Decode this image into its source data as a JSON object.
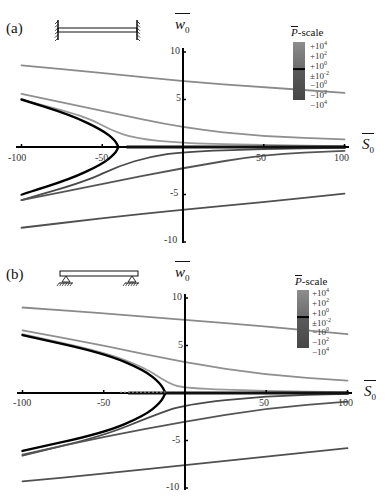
{
  "chart_data": [
    {
      "type": "line",
      "panel_label": "(a)",
      "boundary_condition": "clamped-clamped beam",
      "xlabel": "S̄0",
      "ylabel": "w̄0",
      "xlim": [
        -100,
        100
      ],
      "ylim": [
        -10,
        10
      ],
      "x_ticks": [
        "-100",
        "-50",
        "50",
        "100"
      ],
      "y_ticks": [
        "10",
        "5",
        "-5",
        "-10"
      ],
      "colorbar": {
        "title": "P̄-scale",
        "ticks": [
          "+10^4",
          "+10^2",
          "+10^0",
          "±10^-2",
          "-10^0",
          "-10^2",
          "-10^4"
        ]
      },
      "grid": false,
      "series": [
        {
          "name": "upper-far",
          "color": "#8a8a8a",
          "x": [
            -100,
            -50,
            0,
            50,
            100
          ],
          "y": [
            8.6,
            7.8,
            6.9,
            6.3,
            5.7
          ]
        },
        {
          "name": "upper-mid",
          "color": "#8f8f8f",
          "x": [
            -100,
            -50,
            0,
            50,
            100
          ],
          "y": [
            5.6,
            3.8,
            2.0,
            1.1,
            0.8
          ]
        },
        {
          "name": "upper-near",
          "color": "#9a9a9a",
          "x": [
            -100,
            -60,
            -45,
            -30,
            0,
            50,
            100
          ],
          "y": [
            5.0,
            3.2,
            1.8,
            0.9,
            0.4,
            0.2,
            0.1
          ]
        },
        {
          "name": "critical-upper",
          "color": "#000000",
          "x": [
            -100,
            -70,
            -50,
            -42,
            -40
          ],
          "y": [
            5.0,
            3.4,
            1.8,
            0.7,
            0.0
          ]
        },
        {
          "name": "critical-lower",
          "color": "#000000",
          "x": [
            -40,
            -42,
            -50,
            -70,
            -100
          ],
          "y": [
            0.0,
            -0.7,
            -1.8,
            -3.4,
            -5.0
          ]
        },
        {
          "name": "lower-near",
          "color": "#4a4a4a",
          "x": [
            -100,
            -60,
            -40,
            -20,
            0,
            50,
            100
          ],
          "y": [
            -5.6,
            -3.6,
            -2.0,
            -1.0,
            -0.5,
            -0.2,
            -0.1
          ]
        },
        {
          "name": "lower-mid",
          "color": "#555555",
          "x": [
            -100,
            -50,
            0,
            50,
            100
          ],
          "y": [
            -5.6,
            -3.9,
            -2.2,
            -0.8,
            -0.4
          ]
        },
        {
          "name": "lower-far",
          "color": "#505050",
          "x": [
            -100,
            -50,
            0,
            50,
            100
          ],
          "y": [
            -8.5,
            -7.5,
            -6.6,
            -5.8,
            -4.9
          ]
        }
      ]
    },
    {
      "type": "line",
      "panel_label": "(b)",
      "boundary_condition": "simply-supported beam",
      "xlabel": "S̄0",
      "ylabel": "w̄0",
      "xlim": [
        -100,
        100
      ],
      "ylim": [
        -10,
        10
      ],
      "x_ticks": [
        "-100",
        "-50",
        "50",
        "100"
      ],
      "y_ticks": [
        "10",
        "5",
        "-5",
        "-10"
      ],
      "colorbar": {
        "title": "P̄-scale",
        "ticks": [
          "+10^4",
          "+10^2",
          "+10^0",
          "±10^-2",
          "-10^0",
          "-10^2",
          "-10^4"
        ]
      },
      "grid": false,
      "series": [
        {
          "name": "upper-far",
          "color": "#8a8a8a",
          "x": [
            -100,
            -50,
            0,
            50,
            100
          ],
          "y": [
            9.0,
            8.4,
            7.7,
            7.0,
            6.2
          ]
        },
        {
          "name": "upper-mid",
          "color": "#8f8f8f",
          "x": [
            -100,
            -50,
            0,
            50,
            100
          ],
          "y": [
            6.6,
            5.0,
            3.2,
            1.9,
            1.3
          ]
        },
        {
          "name": "upper-near",
          "color": "#9a9a9a",
          "x": [
            -100,
            -50,
            -25,
            -10,
            0,
            50,
            100
          ],
          "y": [
            6.2,
            4.3,
            2.7,
            1.0,
            0.5,
            0.2,
            0.1
          ]
        },
        {
          "name": "critical-upper",
          "color": "#000000",
          "x": [
            -100,
            -50,
            -25,
            -15,
            -12
          ],
          "y": [
            6.1,
            4.2,
            2.4,
            1.0,
            0.0
          ]
        },
        {
          "name": "critical-lower",
          "color": "#000000",
          "x": [
            -12,
            -15,
            -25,
            -50,
            -100
          ],
          "y": [
            0.0,
            -1.0,
            -2.4,
            -4.2,
            -6.1
          ]
        },
        {
          "name": "lower-near",
          "color": "#4a4a4a",
          "x": [
            -100,
            -50,
            -20,
            0,
            50,
            100
          ],
          "y": [
            -6.6,
            -4.5,
            -2.4,
            -1.2,
            -0.3,
            -0.1
          ]
        },
        {
          "name": "lower-mid",
          "color": "#555555",
          "x": [
            -100,
            -50,
            0,
            50,
            100
          ],
          "y": [
            -6.5,
            -4.6,
            -3.0,
            -1.6,
            -0.9
          ]
        },
        {
          "name": "lower-far",
          "color": "#505050",
          "x": [
            -100,
            -50,
            0,
            50,
            100
          ],
          "y": [
            -9.3,
            -8.5,
            -7.6,
            -6.7,
            -5.8
          ]
        }
      ],
      "annotations": [
        "dashed segment on S̄0 axis from -40 to -12"
      ]
    }
  ],
  "panels": {
    "a": {
      "label": "(a)",
      "ylabel": "w",
      "ylabel_sub": "0",
      "xlabel": "S",
      "xlabel_sub": "0",
      "x_ticks": [
        "-100",
        "-50",
        "50",
        "100"
      ],
      "y_ticks": [
        "10",
        "5",
        "-5",
        "-10"
      ],
      "colorbar_title_symbol": "P",
      "colorbar_title_suffix": "-scale",
      "colorbar_ticks": [
        {
          "base": "+10",
          "exp": "4"
        },
        {
          "base": "+10",
          "exp": "2"
        },
        {
          "base": "+10",
          "exp": "0"
        },
        {
          "base": "±10",
          "exp": "-2"
        },
        {
          "base": "−10",
          "exp": "0"
        },
        {
          "base": "−10",
          "exp": "2"
        },
        {
          "base": "−10",
          "exp": "4"
        }
      ]
    },
    "b": {
      "label": "(b)",
      "ylabel": "w",
      "ylabel_sub": "0",
      "xlabel": "S",
      "xlabel_sub": "0",
      "x_ticks": [
        "-100",
        "-50",
        "50",
        "100"
      ],
      "y_ticks": [
        "10",
        "5",
        "-5",
        "-10"
      ],
      "colorbar_title_symbol": "P",
      "colorbar_title_suffix": "-scale",
      "colorbar_ticks": [
        {
          "base": "+10",
          "exp": "4"
        },
        {
          "base": "+10",
          "exp": "2"
        },
        {
          "base": "+10",
          "exp": "0"
        },
        {
          "base": "±10",
          "exp": "-2"
        },
        {
          "base": "−10",
          "exp": "0"
        },
        {
          "base": "−10",
          "exp": "2"
        },
        {
          "base": "−10",
          "exp": "4"
        }
      ]
    }
  }
}
